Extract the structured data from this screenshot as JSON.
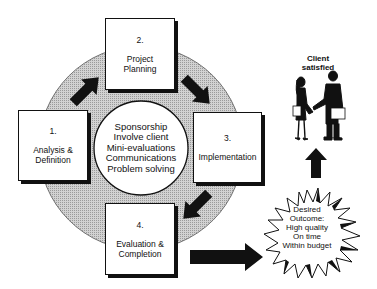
{
  "diagram": {
    "type": "project-cycle",
    "steps": [
      {
        "number": "1.",
        "line1": "Analysis &",
        "line2": "Definition"
      },
      {
        "number": "2.",
        "line1": "Project",
        "line2": "Planning"
      },
      {
        "number": "3.",
        "line1": "Implementation",
        "line2": ""
      },
      {
        "number": "4.",
        "line1": "Evaluation &",
        "line2": "Completion"
      }
    ],
    "center": {
      "items": [
        "Sponsorship",
        "Involve client",
        "Mini-evaluations",
        "Communications",
        "Problem solving"
      ]
    },
    "outcome": {
      "lines": [
        "Desired",
        "Outcome:",
        "High quality",
        "On time",
        "Within budget"
      ]
    },
    "client": {
      "line1": "Client",
      "line2": "satisfied",
      "figure": "handshake-icon"
    },
    "colors": {
      "ring": "#c4c4c4",
      "ink": "#111111",
      "background": "#ffffff"
    }
  }
}
